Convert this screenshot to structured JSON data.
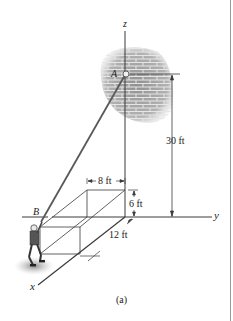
{
  "figure": {
    "caption": "(a)",
    "axes": {
      "x": "x",
      "y": "y",
      "z": "z"
    },
    "points": {
      "A": "A",
      "B": "B"
    },
    "dimensions": {
      "height_A": "30 ft",
      "box_width": "8 ft",
      "box_height": "6 ft",
      "box_depth": "12 ft"
    },
    "colors": {
      "line": "#3a3a3a",
      "rope": "#5a5a5a",
      "wall": "#8c8c8c",
      "shadow": "#9a9a9a"
    }
  }
}
